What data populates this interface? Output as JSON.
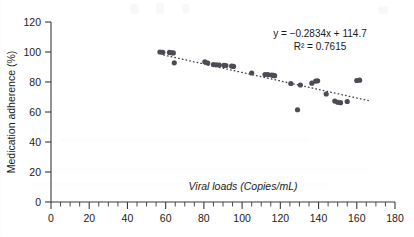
{
  "chart_data": {
    "type": "scatter",
    "title": "",
    "xlabel": "Viral loads (Copies/mL)",
    "ylabel": "Medication adherence (%)",
    "xlim": [
      0,
      180
    ],
    "ylim": [
      0,
      120
    ],
    "xticks": [
      0,
      20,
      40,
      60,
      80,
      100,
      120,
      140,
      160,
      180
    ],
    "yticks": [
      0,
      20,
      40,
      60,
      80,
      100,
      120
    ],
    "x_minor_tick_interval": 5,
    "grid": false,
    "legend": null,
    "marker_color": "#4c4c55",
    "trendline_color": "#3c3c44",
    "annotations": {
      "equation": "y = −0.2834x + 114.7",
      "r_squared": "R² = 0.7615"
    },
    "trendline": {
      "style": "dotted",
      "slope": -0.2834,
      "intercept": 114.7,
      "r_squared": 0.7615,
      "x_start": 59,
      "x_end": 166
    },
    "points": [
      {
        "x": 57.0,
        "y": 100.0
      },
      {
        "x": 58.5,
        "y": 99.8
      },
      {
        "x": 62.0,
        "y": 99.7
      },
      {
        "x": 63.0,
        "y": 99.5
      },
      {
        "x": 64.0,
        "y": 99.4
      },
      {
        "x": 64.5,
        "y": 92.8
      },
      {
        "x": 80.5,
        "y": 93.5
      },
      {
        "x": 82.0,
        "y": 92.6
      },
      {
        "x": 85.0,
        "y": 91.6
      },
      {
        "x": 86.5,
        "y": 91.5
      },
      {
        "x": 88.0,
        "y": 91.3
      },
      {
        "x": 90.5,
        "y": 91.1
      },
      {
        "x": 91.5,
        "y": 91.0
      },
      {
        "x": 94.5,
        "y": 90.6
      },
      {
        "x": 95.5,
        "y": 90.4
      },
      {
        "x": 105.0,
        "y": 86.0
      },
      {
        "x": 112.0,
        "y": 85.0
      },
      {
        "x": 113.5,
        "y": 84.9
      },
      {
        "x": 115.5,
        "y": 84.6
      },
      {
        "x": 116.5,
        "y": 84.4
      },
      {
        "x": 117.0,
        "y": 84.2
      },
      {
        "x": 125.5,
        "y": 79.0
      },
      {
        "x": 129.0,
        "y": 61.5
      },
      {
        "x": 130.5,
        "y": 78.0
      },
      {
        "x": 136.5,
        "y": 79.2
      },
      {
        "x": 138.5,
        "y": 80.6
      },
      {
        "x": 139.5,
        "y": 80.8
      },
      {
        "x": 144.0,
        "y": 72.0
      },
      {
        "x": 148.5,
        "y": 67.3
      },
      {
        "x": 150.0,
        "y": 66.5
      },
      {
        "x": 151.5,
        "y": 66.2
      },
      {
        "x": 155.0,
        "y": 67.0
      },
      {
        "x": 160.0,
        "y": 81.0
      },
      {
        "x": 161.5,
        "y": 81.2
      }
    ]
  }
}
